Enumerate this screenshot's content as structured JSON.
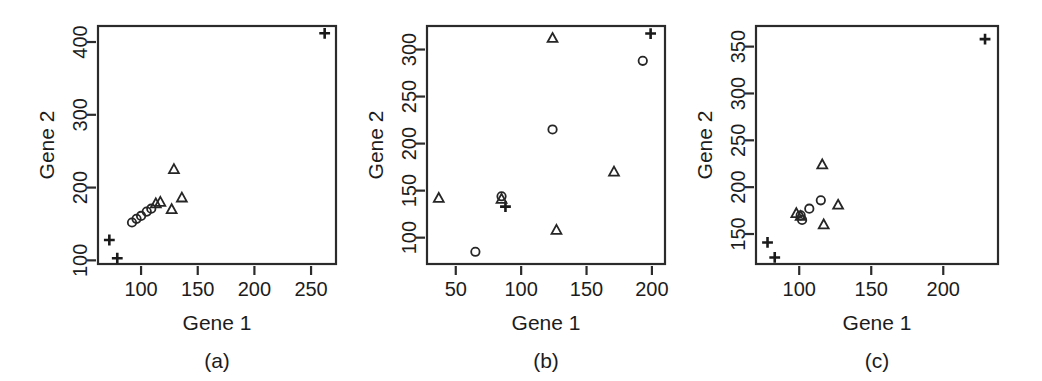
{
  "figure": {
    "background": "#ffffff",
    "foreground": "#1c1c1c",
    "panel_count": 3
  },
  "panels": [
    {
      "id": "a",
      "caption": "(a)",
      "xlabel": "Gene 1",
      "ylabel": "Gene 2",
      "xticks": [
        100,
        150,
        200,
        250
      ],
      "yticks": [
        100,
        200,
        300,
        400
      ],
      "xlim": [
        62,
        272
      ],
      "ylim": [
        95,
        422
      ]
    },
    {
      "id": "b",
      "caption": "(b)",
      "xlabel": "Gene 1",
      "ylabel": "Gene 2",
      "xticks": [
        50,
        100,
        150,
        200
      ],
      "yticks": [
        100,
        150,
        200,
        250,
        300
      ],
      "xlim": [
        28,
        210
      ],
      "ylim": [
        72,
        325
      ]
    },
    {
      "id": "c",
      "caption": "(c)",
      "xlabel": "Gene 1",
      "ylabel": "Gene 2",
      "xticks": [
        100,
        150,
        200
      ],
      "yticks": [
        150,
        200,
        250,
        300,
        350
      ],
      "xlim": [
        70,
        238
      ],
      "ylim": [
        118,
        372
      ]
    }
  ],
  "chart_data": [
    {
      "type": "scatter",
      "title": "(a)",
      "xlabel": "Gene 1",
      "ylabel": "Gene 2",
      "xlim": [
        62,
        272
      ],
      "ylim": [
        95,
        422
      ],
      "xticks": [
        100,
        150,
        200,
        250
      ],
      "yticks": [
        100,
        200,
        300,
        400
      ],
      "grid": false,
      "legend": "none",
      "series": [
        {
          "name": "plus",
          "marker": "plus",
          "points": [
            [
              72,
              128
            ],
            [
              79,
              103
            ],
            [
              262,
              412
            ]
          ]
        },
        {
          "name": "circle",
          "marker": "circle",
          "points": [
            [
              92,
              152
            ],
            [
              96,
              157
            ],
            [
              100,
              161
            ],
            [
              105,
              167
            ],
            [
              109,
              171
            ]
          ]
        },
        {
          "name": "triangle",
          "marker": "triangle",
          "points": [
            [
              113,
              178
            ],
            [
              117,
              180
            ],
            [
              127,
              170
            ],
            [
              129,
              225
            ],
            [
              136,
              186
            ]
          ]
        }
      ]
    },
    {
      "type": "scatter",
      "title": "(b)",
      "xlabel": "Gene 1",
      "ylabel": "Gene 2",
      "xlim": [
        28,
        210
      ],
      "ylim": [
        72,
        325
      ],
      "xticks": [
        50,
        100,
        150,
        200
      ],
      "yticks": [
        100,
        150,
        200,
        250,
        300
      ],
      "grid": false,
      "legend": "none",
      "series": [
        {
          "name": "plus",
          "marker": "plus",
          "points": [
            [
              88,
              133
            ],
            [
              199,
              317
            ]
          ]
        },
        {
          "name": "circle",
          "marker": "circle",
          "points": [
            [
              65,
              85
            ],
            [
              85,
              144
            ],
            [
              124,
              215
            ],
            [
              193,
              288
            ]
          ]
        },
        {
          "name": "triangle",
          "marker": "triangle",
          "points": [
            [
              37,
              142
            ],
            [
              85,
              141
            ],
            [
              127,
              108
            ],
            [
              124,
              312
            ],
            [
              171,
              170
            ]
          ]
        }
      ]
    },
    {
      "type": "scatter",
      "title": "(c)",
      "xlabel": "Gene 1",
      "ylabel": "Gene 2",
      "xlim": [
        70,
        238
      ],
      "ylim": [
        118,
        372
      ],
      "xticks": [
        100,
        150,
        200
      ],
      "yticks": [
        150,
        200,
        250,
        300,
        350
      ],
      "grid": false,
      "legend": "none",
      "series": [
        {
          "name": "plus",
          "marker": "plus",
          "points": [
            [
              78,
              141
            ],
            [
              83,
              125
            ],
            [
              229,
              358
            ]
          ]
        },
        {
          "name": "circle",
          "marker": "circle",
          "points": [
            [
              101,
              170
            ],
            [
              102,
              165
            ],
            [
              107,
              177
            ],
            [
              115,
              186
            ]
          ]
        },
        {
          "name": "triangle",
          "marker": "triangle",
          "points": [
            [
              98,
              172
            ],
            [
              101,
              169
            ],
            [
              116,
              224
            ],
            [
              117,
              160
            ],
            [
              127,
              181
            ]
          ]
        }
      ]
    }
  ]
}
